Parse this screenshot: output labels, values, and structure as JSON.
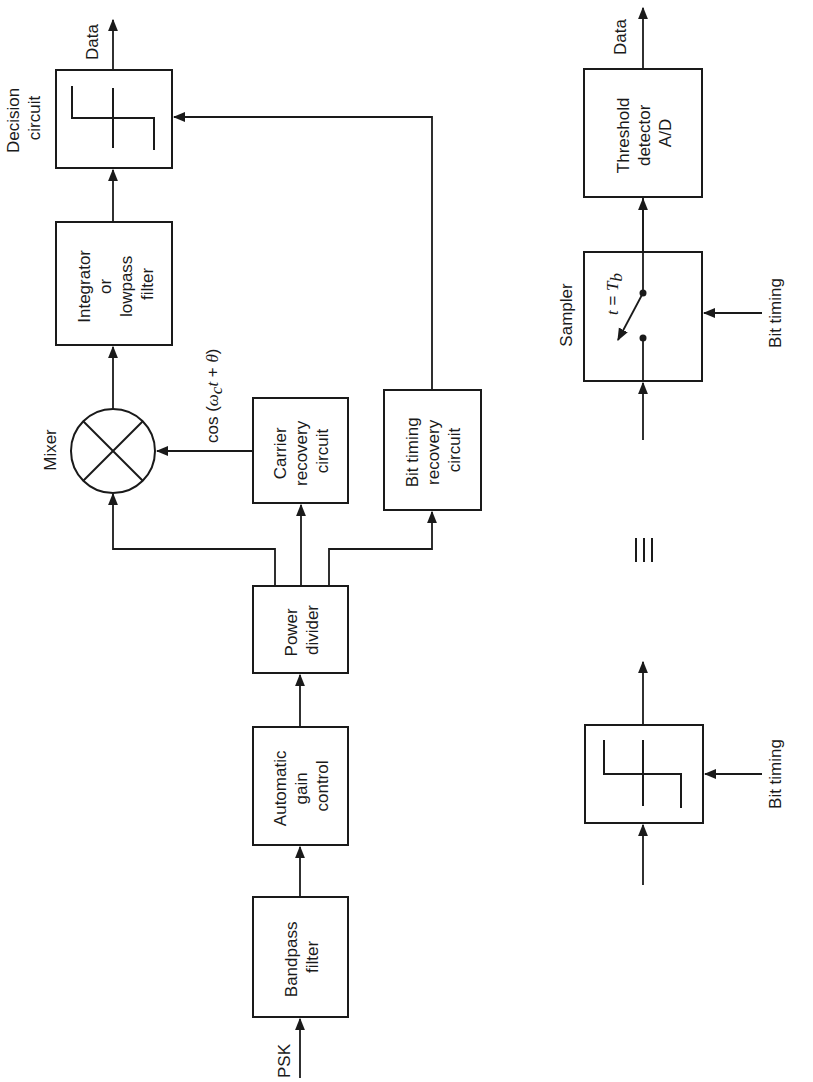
{
  "diagram": {
    "orientation": "rotated -90deg (signal flows bottom to top)",
    "input_label": "PSK",
    "blocks": {
      "bandpass": [
        "Bandpass",
        "filter"
      ],
      "agc": [
        "Automatic",
        "gain",
        "control"
      ],
      "power_divider": [
        "Power",
        "divider"
      ],
      "carrier_recovery": [
        "Carrier",
        "recovery",
        "circuit"
      ],
      "bit_timing_recovery": [
        "Bit timing",
        "recovery",
        "circuit"
      ],
      "mixer": "Mixer",
      "integrator": [
        "Integrator",
        "or",
        "lowpass",
        "filter"
      ],
      "decision": [
        "Decision",
        "circuit"
      ],
      "sampler": "Sampler",
      "threshold": [
        "Threshold",
        "detector",
        "A/D"
      ]
    },
    "carrier_signal": "cos (ωct + θ)",
    "carrier_signal_parts": {
      "prefix": "cos (",
      "omega": "ω",
      "sub": "c",
      "t": "t",
      "plus": " + ",
      "theta": "θ",
      "suffix": ")"
    },
    "sampler_expr": {
      "t": "t",
      "eq": " = ",
      "T": "T",
      "sub": "b"
    },
    "output_label": "Data",
    "bit_timing_label": "Bit timing",
    "equivalence_symbol": "≡"
  },
  "colors": {
    "ink": "#1a1a1a",
    "background": "#ffffff"
  }
}
